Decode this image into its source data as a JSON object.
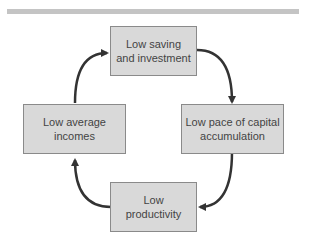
{
  "diagram": {
    "type": "cycle",
    "nodes": [
      {
        "id": "top",
        "line1": "Low saving",
        "line2": "and investment"
      },
      {
        "id": "right",
        "line1": "Low pace of capital",
        "line2": "accumulation"
      },
      {
        "id": "bottom",
        "line1": "Low",
        "line2": "productivity"
      },
      {
        "id": "left",
        "line1": "Low average",
        "line2": "incomes"
      }
    ],
    "edges": [
      {
        "from": "top",
        "to": "right"
      },
      {
        "from": "right",
        "to": "bottom"
      },
      {
        "from": "bottom",
        "to": "left"
      },
      {
        "from": "left",
        "to": "top"
      }
    ],
    "colors": {
      "box_fill": "#d9d9d9",
      "box_border": "#8a8a8a",
      "arrow": "#333333",
      "rule": "#c4c4c4"
    }
  }
}
